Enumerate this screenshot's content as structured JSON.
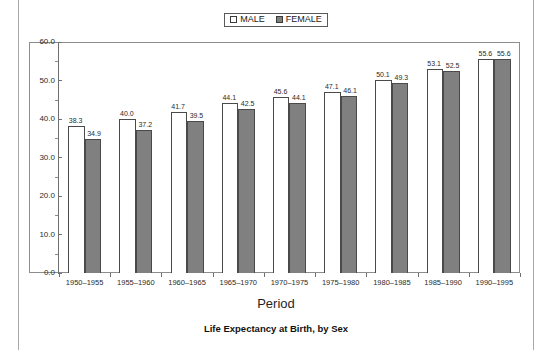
{
  "legend": {
    "items": [
      {
        "label": "MALE",
        "swatch": "legend-swatch-male",
        "color": "#ffffff"
      },
      {
        "label": "FEMALE",
        "swatch": "legend-swatch-female",
        "color": "#808080"
      }
    ]
  },
  "chart_data": {
    "type": "bar",
    "title": "Life Expectancy at Birth, by Sex",
    "xlabel": "Period",
    "ylabel": "",
    "ylim": [
      0,
      60
    ],
    "ytick_step": 10,
    "ytick_labels": [
      "60.0",
      "50.0",
      "40.0",
      "30.0",
      "20.0",
      "10.0",
      "0.0"
    ],
    "grid": false,
    "legend_position": "top-center",
    "categories": [
      "1950–1955",
      "1955–1960",
      "1960–1965",
      "1965–1970",
      "1970–1975",
      "1975–1980",
      "1980–1985",
      "1985–1990",
      "1990–1995"
    ],
    "series": [
      {
        "name": "MALE",
        "color": "#ffffff",
        "values": [
          38.3,
          40.0,
          41.7,
          44.1,
          45.6,
          47.1,
          50.1,
          53.1,
          55.6
        ],
        "labels": [
          "38.3",
          "40.0",
          "41.7",
          "44.1",
          "45.6",
          "47.1",
          "50.1",
          "53.1",
          "55.6"
        ]
      },
      {
        "name": "FEMALE",
        "color": "#808080",
        "values": [
          34.9,
          37.2,
          39.5,
          42.5,
          44.1,
          46.1,
          49.3,
          52.5,
          55.6
        ],
        "labels": [
          "34.9",
          "37.2",
          "39.5",
          "42.5",
          "44.1",
          "46.1",
          "49.3",
          "52.5",
          "55.6"
        ]
      }
    ]
  }
}
